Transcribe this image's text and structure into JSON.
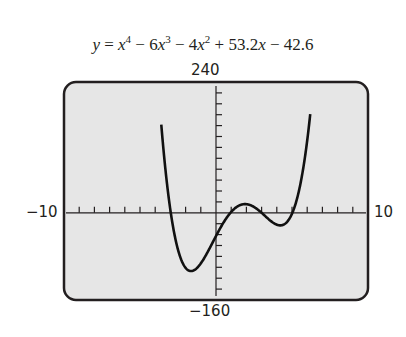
{
  "chart_data": {
    "type": "line",
    "equation": {
      "lhs": "y",
      "terms": [
        "x⁴",
        "− 6x³",
        "− 4x²",
        "+ 53.2x",
        "− 42.6"
      ]
    },
    "function": "x^4 - 6x^3 - 4x^2 + 53.2x - 42.6",
    "xlim": [
      -10,
      10
    ],
    "ylim": [
      -160,
      240
    ],
    "xscale": 1,
    "yscale": 20,
    "axis_labels": {
      "xmin": "−10",
      "xmax": "10",
      "ymax": "240",
      "ymin": "−160"
    },
    "grid": false,
    "background": "#e6e6e6",
    "line_color": "#111111",
    "local_minima": [
      [
        -2.05,
        -133
      ],
      [
        4.5,
        -32
      ]
    ],
    "local_maximum": [
      1.3,
      7
    ]
  }
}
